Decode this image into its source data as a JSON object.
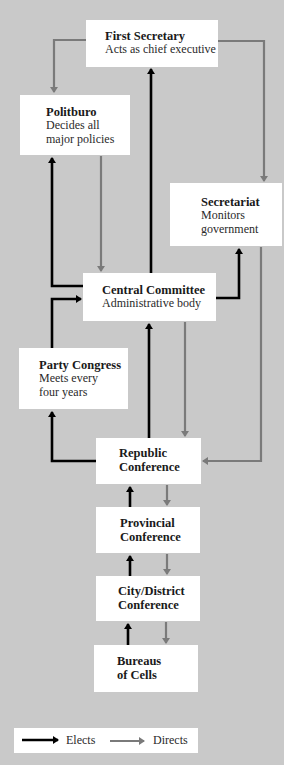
{
  "colors": {
    "background": "#c9c9c9",
    "box": "#ffffff",
    "elects": "#000000",
    "directs": "#7a7a7a"
  },
  "nodes": {
    "first_secretary": {
      "title": "First Secretary",
      "desc": "Acts as chief executive"
    },
    "politburo": {
      "title": "Politburo",
      "desc1": "Decides all",
      "desc2": "major policies"
    },
    "secretariat": {
      "title": "Secretariat",
      "desc1": "Monitors",
      "desc2": "government"
    },
    "central_committee": {
      "title": "Central Committee",
      "desc": "Administrative body"
    },
    "party_congress": {
      "title": "Party Congress",
      "desc1": "Meets every",
      "desc2": "four years"
    },
    "republic_conference": {
      "line1": "Republic",
      "line2": "Conference"
    },
    "provincial_conference": {
      "line1": "Provincial",
      "line2": "Conference"
    },
    "city_district_conference": {
      "line1": "City/District",
      "line2": "Conference"
    },
    "bureaus_of_cells": {
      "line1": "Bureaus",
      "line2": "of Cells"
    }
  },
  "edges": [
    {
      "from": "First Secretary",
      "to": "Politburo",
      "type": "directs"
    },
    {
      "from": "First Secretary",
      "to": "Secretariat",
      "type": "directs"
    },
    {
      "from": "Central Committee",
      "to": "First Secretary",
      "type": "elects"
    },
    {
      "from": "Central Committee",
      "to": "Politburo",
      "type": "elects"
    },
    {
      "from": "Central Committee",
      "to": "Secretariat",
      "type": "elects"
    },
    {
      "from": "Politburo",
      "to": "Central Committee",
      "type": "directs"
    },
    {
      "from": "Party Congress",
      "to": "Central Committee",
      "type": "elects"
    },
    {
      "from": "Secretariat",
      "to": "Republic Conference",
      "type": "directs"
    },
    {
      "from": "Central Committee",
      "to": "Republic Conference",
      "type": "directs"
    },
    {
      "from": "Republic Conference",
      "to": "Central Committee",
      "type": "elects"
    },
    {
      "from": "Republic Conference",
      "to": "Party Congress",
      "type": "elects"
    },
    {
      "from": "Provincial Conference",
      "to": "Republic Conference",
      "type": "elects"
    },
    {
      "from": "Republic Conference",
      "to": "Provincial Conference",
      "type": "directs"
    },
    {
      "from": "City/District Conference",
      "to": "Provincial Conference",
      "type": "elects"
    },
    {
      "from": "Provincial Conference",
      "to": "City/District Conference",
      "type": "directs"
    },
    {
      "from": "Bureaus of Cells",
      "to": "City/District Conference",
      "type": "elects"
    },
    {
      "from": "City/District Conference",
      "to": "Bureaus of Cells",
      "type": "directs"
    }
  ],
  "legend": {
    "elects": "Elects",
    "directs": "Directs"
  }
}
